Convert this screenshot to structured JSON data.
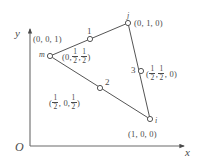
{
  "figure": {
    "kind": "geometric-diagram",
    "background_color": "#ffffff",
    "stroke_color": "#4a4a4a"
  },
  "axes": {
    "origin_label": "O",
    "x_label": "x",
    "y_label": "y",
    "x_axis": {
      "x1": 30,
      "y1": 146,
      "x2": 186,
      "y2": 146
    },
    "y_axis": {
      "x1": 30,
      "y1": 146,
      "x2": 30,
      "y2": 27
    }
  },
  "nodes": [
    {
      "id": "m",
      "name_label": "m",
      "coord_label": "(0, 0, 1)",
      "coord_parts": [
        "(0, 0, 1)"
      ],
      "cx": 50,
      "cy": 56
    },
    {
      "id": "1",
      "name_label": "1",
      "coord_prefix": "(0,",
      "coord_frac1_num": "1",
      "coord_frac1_den": "2",
      "coord_mid": ",",
      "coord_frac2_num": "1",
      "coord_frac2_den": "2",
      "coord_suffix": ")",
      "cx": 90,
      "cy": 39
    },
    {
      "id": "j",
      "name_label": "j",
      "coord_label": "(0, 1, 0)",
      "cx": 128,
      "cy": 23
    },
    {
      "id": "3",
      "name_label": "3",
      "coord_prefix": "(",
      "coord_frac1_num": "1",
      "coord_frac1_den": "2",
      "coord_mid": ",",
      "coord_frac2_num": "1",
      "coord_frac2_den": "2",
      "coord_suffix": ", 0)",
      "cx": 141,
      "cy": 71
    },
    {
      "id": "i",
      "name_label": "i",
      "coord_label": "(1, 0, 0)",
      "cx": 150,
      "cy": 119
    },
    {
      "id": "2",
      "name_label": "2",
      "coord_prefix": "(",
      "coord_frac1_num": "1",
      "coord_frac1_den": "2",
      "coord_mid": ", 0,",
      "coord_frac2_num": "1",
      "coord_frac2_den": "2",
      "coord_suffix": ")",
      "cx": 100,
      "cy": 88
    }
  ],
  "edges": [
    {
      "name": "edge-m-j",
      "x1": 50,
      "y1": 56,
      "x2": 128,
      "y2": 23
    },
    {
      "name": "edge-j-i",
      "x1": 128,
      "y1": 23,
      "x2": 150,
      "y2": 119
    },
    {
      "name": "edge-i-m",
      "x1": 150,
      "y1": 119,
      "x2": 50,
      "y2": 56
    }
  ]
}
